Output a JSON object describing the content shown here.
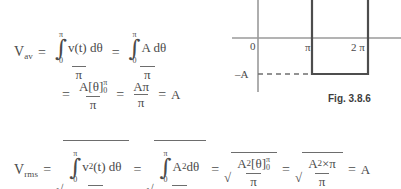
{
  "page": {
    "background": "#ffffff",
    "ink": "#4a4a4a"
  },
  "equations": {
    "average": {
      "lhs_symbol": "V",
      "lhs_subscript": "av",
      "eq1": "=",
      "term1": {
        "numerator": {
          "integral_glyph": "∫",
          "upper_limit": "π",
          "lower_limit": "0",
          "integrand": "v(t) dθ"
        },
        "denominator": "π"
      },
      "eq2": "=",
      "term2": {
        "numerator": {
          "integral_glyph": "∫",
          "upper_limit": "π",
          "lower_limit": "0",
          "integrand": "A dθ"
        },
        "denominator": "π"
      },
      "line2_eq": "=",
      "term3": {
        "numerator_prefix": "A",
        "bracket_open": "[",
        "bracket_var": "θ",
        "bracket_close": "]",
        "bracket_lower": "0",
        "bracket_upper": "π",
        "denominator": "π"
      },
      "eq3": "=",
      "term4": {
        "numerator": "Aπ",
        "denominator": "π"
      },
      "eq4": "=",
      "result": "A"
    },
    "rms": {
      "lhs_symbol": "V",
      "lhs_subscript": "rms",
      "eq1": "=",
      "term1": {
        "radical": "√",
        "numerator": {
          "integral_glyph": "∫",
          "upper_limit": "π",
          "lower_limit": "0",
          "integrand_base": "v",
          "integrand_exp": "2",
          "integrand_rest": "(t) dθ"
        },
        "denominator": "π"
      },
      "eq2": "=",
      "term2": {
        "radical": "√",
        "numerator": {
          "integral_glyph": "∫",
          "upper_limit": "π",
          "lower_limit": "0",
          "integrand_base": "A",
          "integrand_exp": "2",
          "integrand_rest": "dθ"
        },
        "denominator": "π"
      },
      "eq3": "=",
      "term3": {
        "radical": "√",
        "numerator_base": "A",
        "numerator_exp": "2",
        "bracket_open": "[",
        "bracket_var": "θ",
        "bracket_close": "]",
        "bracket_lower": "0",
        "bracket_upper": "π",
        "denominator": "π"
      },
      "eq4": "=",
      "term4": {
        "radical": "√",
        "numerator_base": "A",
        "numerator_exp": "2",
        "numerator_rest": "×π",
        "denominator": "π"
      },
      "eq5": "=",
      "result": "A"
    }
  },
  "figure": {
    "caption": "Fig. 3.8.6",
    "axis_color": "#9a9a9a",
    "wave_color": "#4d4d4d",
    "dash_color": "#6f6f6f",
    "x_ticks": [
      {
        "label": "0",
        "x": 0
      },
      {
        "label": "π",
        "x": 1
      },
      {
        "label": "2 π",
        "x": 2
      }
    ],
    "y_labels": [
      {
        "label": "–A",
        "value": -1
      }
    ],
    "waveform": {
      "type": "square",
      "levels": [
        {
          "from": 0,
          "to": 1,
          "value": 1
        },
        {
          "from": 1,
          "to": 2,
          "value": -1
        }
      ]
    }
  }
}
